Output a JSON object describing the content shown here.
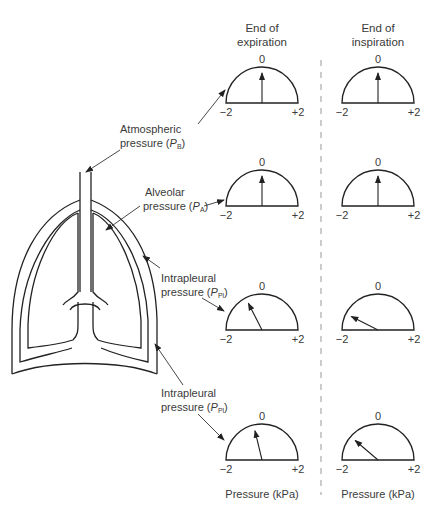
{
  "columns": {
    "expiration": {
      "line1": "End of",
      "line2": "expiration"
    },
    "inspiration": {
      "line1": "End of",
      "line2": "inspiration"
    }
  },
  "scale": {
    "min_label": "−2",
    "zero_label": "0",
    "max_label": "+2",
    "unit_label": "Pressure (kPa)"
  },
  "labels": {
    "atmospheric": {
      "line1": "Atmospheric",
      "line2": "pressure (",
      "symbol": "P",
      "sub": "B",
      "close": ")"
    },
    "alveolar": {
      "line1": "Alveolar",
      "line2": "pressure (",
      "symbol": "P",
      "sub": "A",
      "close": ")"
    },
    "intrapleural_1": {
      "line1": "Intrapleural",
      "line2": "pressure (",
      "symbol": "P",
      "sub": "Pl",
      "close": ")"
    },
    "intrapleural_2": {
      "line1": "Intrapleural",
      "line2": "pressure (",
      "symbol": "P",
      "sub": "Pl",
      "close": ")"
    }
  },
  "gauges": [
    {
      "row": "atmospheric",
      "expiration_kPa": 0,
      "inspiration_kPa": 0
    },
    {
      "row": "alveolar",
      "expiration_kPa": 0,
      "inspiration_kPa": 0
    },
    {
      "row": "intrapleural_1",
      "expiration_kPa": -0.6,
      "inspiration_kPa": -1.4
    },
    {
      "row": "intrapleural_2",
      "expiration_kPa": -0.3,
      "inspiration_kPa": -1.1
    }
  ]
}
